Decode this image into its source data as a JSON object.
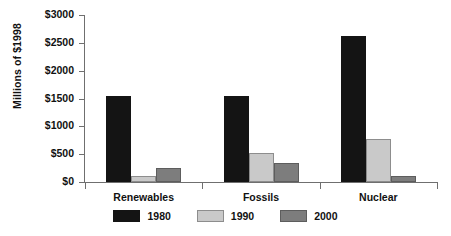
{
  "chart_data": {
    "type": "bar",
    "title": "",
    "xlabel": "",
    "ylabel": "Millions of $1998",
    "categories": [
      "Renewables",
      "Fossils",
      "Nuclear"
    ],
    "series": [
      {
        "name": "1980",
        "color": "#141414",
        "values": [
          1540,
          1540,
          2620
        ]
      },
      {
        "name": "1990",
        "color": "#c9c9c9",
        "values": [
          100,
          520,
          780
        ]
      },
      {
        "name": "2000",
        "color": "#7d7d7d",
        "values": [
          260,
          340,
          110
        ]
      }
    ],
    "ylim": [
      0,
      3000
    ],
    "ytick_values": [
      0,
      500,
      1000,
      1500,
      2000,
      2500,
      3000
    ],
    "ytick_labels": [
      "$0",
      "$500",
      "$1000",
      "$1500",
      "$2000",
      "$2500",
      "$3000"
    ],
    "grid": false,
    "legend_position": "bottom"
  },
  "legend": {
    "items": [
      {
        "label": "1980"
      },
      {
        "label": "1990"
      },
      {
        "label": "2000"
      }
    ]
  }
}
